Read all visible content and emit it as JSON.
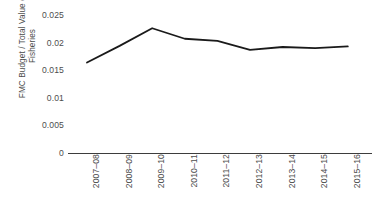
{
  "chart_data": {
    "type": "line",
    "title": "",
    "subtitle": "",
    "xlabel": "",
    "ylabel": "FMC Budget / Total Value of\nFisheries",
    "categories": [
      "2007–08",
      "2008–09",
      "2009–10",
      "2010–11",
      "2011–12",
      "2012–13",
      "2013–14",
      "2014–15",
      "2015–16"
    ],
    "values": [
      0.0164,
      0.0194,
      0.0226,
      0.0207,
      0.0203,
      0.0187,
      0.0192,
      0.019,
      0.0193
    ],
    "series": [
      {
        "name": "FMC Budget / Total Value of Fisheries",
        "values": [
          0.0164,
          0.0194,
          0.0226,
          0.0207,
          0.0203,
          0.0187,
          0.0192,
          0.019,
          0.0193
        ]
      }
    ],
    "ylim": [
      0,
      0.025
    ],
    "yticks": [
      0,
      0.005,
      0.01,
      0.015,
      0.02,
      0.025
    ],
    "ytick_labels": [
      "0",
      "0.005",
      "0.01",
      "0.015",
      "0.02",
      "0.025"
    ],
    "grid": false,
    "legend": "none",
    "line_color": "#1a1a1a",
    "axis_color": "#3d3d3d",
    "text_color": "#4d4d4d",
    "background_color": "#ffffff",
    "markers": false,
    "line_width": 1.8
  }
}
